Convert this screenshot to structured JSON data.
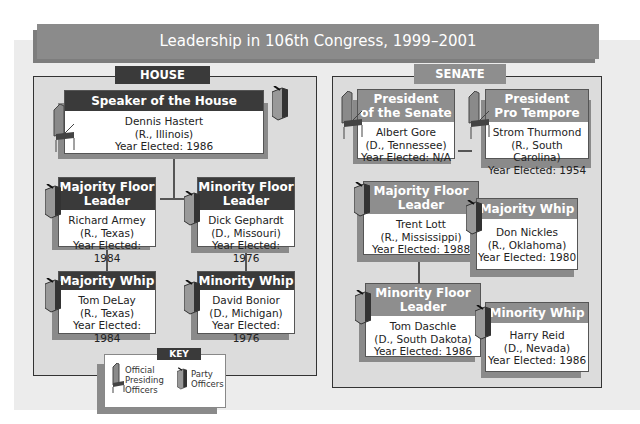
{
  "title": "Leadership in 106th Congress, 1999–2001",
  "house": {
    "label": "HOUSE",
    "speaker": {
      "title": "Speaker of the House",
      "name": "Dennis Hastert",
      "party": "(R., Illinois)",
      "year": "Year Elected: 1986"
    },
    "majority_leader": {
      "title1": "Majority Floor",
      "title2": "Leader",
      "name": "Richard Armey",
      "party": "(R., Texas)",
      "year": "Year Elected: 1984"
    },
    "minority_leader": {
      "title1": "Minority Floor",
      "title2": "Leader",
      "name": "Dick Gephardt",
      "party": "(D., Missouri)",
      "year": "Year Elected: 1976"
    },
    "majority_whip": {
      "title": "Majority Whip",
      "name": "Tom DeLay",
      "party": "(R., Texas)",
      "year": "Year Elected: 1984"
    },
    "minority_whip": {
      "title": "Minority Whip",
      "name": "David  Bonior",
      "party": "(D., Michigan)",
      "year": "Year Elected: 1976"
    }
  },
  "senate": {
    "label": "SENATE",
    "president": {
      "title1": "President",
      "title2": "of the Senate",
      "name": "Albert Gore",
      "party": "(D., Tennessee)",
      "year": "Year Elected: N/A"
    },
    "pro_tempore": {
      "title1": "President",
      "title2": "Pro Tempore",
      "name": "Strom Thurmond",
      "party": "(R., South Carolina)",
      "year": "Year Elected: 1954"
    },
    "majority_leader": {
      "title1": "Majority Floor",
      "title2": "Leader",
      "name": "Trent Lott",
      "party": "(R., Mississippi)",
      "year": "Year Elected: 1988"
    },
    "majority_whip": {
      "title": "Majority Whip",
      "name": "Don Nickles",
      "party": "(R., Oklahoma)",
      "year": "Year Elected: 1980"
    },
    "minority_leader": {
      "title1": "Minority Floor",
      "title2": "Leader",
      "name": "Tom Daschle",
      "party": "(D., South Dakota)",
      "year": "Year Elected: 1986"
    },
    "minority_whip": {
      "title": "Minority Whip",
      "name": "Harry Reid",
      "party": "(D., Nevada)",
      "year": "Year Elected: 1986"
    }
  },
  "key": {
    "label": "KEY",
    "presiding1": "Official",
    "presiding2": "Presiding",
    "presiding3": "Officers",
    "party1": "Party",
    "party2": "Officers"
  },
  "colors": {
    "house_dark": "#3a3a3a",
    "senate_mid": "#8e8e8e",
    "title_bar": "#8b8b8b",
    "panel": "#dcdcdc"
  }
}
